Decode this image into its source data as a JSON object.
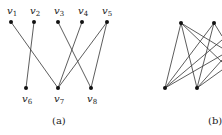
{
  "figures": [
    {
      "id": "a",
      "caption": "(a)",
      "nodes": [
        {
          "id": "v1",
          "label": "v",
          "sub": "1",
          "x": 11,
          "y": 22,
          "lx": 7,
          "ly": 14
        },
        {
          "id": "v2",
          "label": "v",
          "sub": "2",
          "x": 34,
          "y": 22,
          "lx": 30,
          "ly": 14
        },
        {
          "id": "v3",
          "label": "v",
          "sub": "3",
          "x": 58,
          "y": 22,
          "lx": 54,
          "ly": 14
        },
        {
          "id": "v4",
          "label": "v",
          "sub": "4",
          "x": 82,
          "y": 22,
          "lx": 78,
          "ly": 14
        },
        {
          "id": "v5",
          "label": "v",
          "sub": "5",
          "x": 107,
          "y": 22,
          "lx": 102,
          "ly": 14
        },
        {
          "id": "v6",
          "label": "v",
          "sub": "6",
          "x": 26,
          "y": 88,
          "lx": 22,
          "ly": 102
        },
        {
          "id": "v7",
          "label": "v",
          "sub": "7",
          "x": 58,
          "y": 88,
          "lx": 54,
          "ly": 102
        },
        {
          "id": "v8",
          "label": "v",
          "sub": "8",
          "x": 91,
          "y": 88,
          "lx": 87,
          "ly": 102
        }
      ],
      "edges": [
        [
          "v1",
          "v7"
        ],
        [
          "v2",
          "v6"
        ],
        [
          "v3",
          "v8"
        ],
        [
          "v4",
          "v7"
        ],
        [
          "v5",
          "v7"
        ],
        [
          "v5",
          "v8"
        ]
      ],
      "caption_pos": {
        "x": 52,
        "y": 124
      }
    },
    {
      "id": "b",
      "caption": "(b)",
      "nodes": [
        {
          "id": "t1",
          "x": 181,
          "y": 23
        },
        {
          "id": "t2",
          "x": 214,
          "y": 23
        },
        {
          "id": "b1",
          "x": 165,
          "y": 88
        },
        {
          "id": "b2",
          "x": 197,
          "y": 88
        }
      ],
      "edges": [
        [
          "t1",
          "b1"
        ],
        [
          "t1",
          "b2"
        ],
        [
          "t2",
          "b1"
        ],
        [
          "t2",
          "b2"
        ],
        [
          "t1",
          {
            "x": 222,
            "y": 62
          }
        ],
        [
          "t1",
          {
            "x": 222,
            "y": 48
          }
        ],
        [
          "t2",
          {
            "x": 222,
            "y": 36
          }
        ],
        [
          "b1",
          {
            "x": 222,
            "y": 40
          }
        ],
        [
          "b1",
          {
            "x": 222,
            "y": 55
          }
        ],
        [
          "b2",
          {
            "x": 222,
            "y": 60
          }
        ],
        [
          "b2",
          {
            "x": 222,
            "y": 70
          }
        ]
      ],
      "caption_pos": {
        "x": 208,
        "y": 124
      }
    }
  ]
}
